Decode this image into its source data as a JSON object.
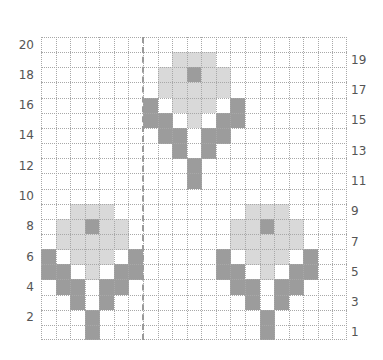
{
  "diagram": {
    "type": "knitting-chart",
    "columns": 21,
    "rows": 20,
    "colors": {
      "background": "#ffffff",
      "light": "#d9d9d9",
      "dark": "#9c9c9c",
      "grid": "#a8a8a8"
    },
    "center_line_after_column": 7,
    "labels_left": [
      "20",
      "18",
      "16",
      "14",
      "12",
      "10",
      "8",
      "6",
      "4",
      "2"
    ],
    "labels_right": [
      "19",
      "17",
      "15",
      "13",
      "11",
      "9",
      "7",
      "5",
      "3",
      "1"
    ],
    "grid": [
      ".....................",
      ".........LLL.........",
      "........LLDLL........",
      "........LLLLL........",
      ".......D.LLL.D.......",
      ".......DD.L.DD.......",
      "........DD.DD........",
      ".........D.D.........",
      "..........D..........",
      "..........D..........",
      ".....................",
      "..LLL.........LLL....",
      ".LLDLL.......LLDLL...",
      ".LLLLL.......LLLLL...",
      "D.LLL.D.....D.LLL.D..",
      "DD.L.DD.....DD.L.DD..",
      ".DD.DD.......DD.DD...",
      "..D.D.........D.D....",
      "...D...........D.....",
      "...D...........D....."
    ],
    "legend": {
      "L": "light gray stitch",
      "D": "dark gray stitch",
      ".": "background stitch"
    }
  }
}
